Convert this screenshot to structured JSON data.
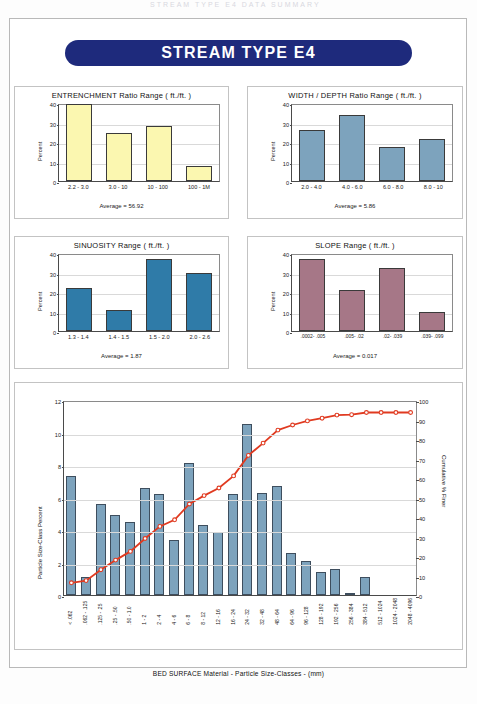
{
  "scan_header": "STREAM  TYPE  E4  DATA  SUMMARY",
  "banner": {
    "title": "STREAM  TYPE  E4"
  },
  "colors": {
    "banner_blue": "#1e2a7c",
    "entrenchment_bar": "#fbf7b0",
    "width_depth_bar": "#7da3bd",
    "sinuosity_bar": "#2f7ba8",
    "slope_bar": "#a67787",
    "bed_bar": "#7da3bd",
    "cumulative_line": "#e03a20"
  },
  "charts": [
    {
      "id": "entrenchment",
      "chart_data": {
        "type": "bar",
        "title": "ENTRENCHMENT  Ratio Range ( ft./ft. )",
        "categories": [
          "2.2 - 3.0",
          "3.0 - 10",
          "10 - 100",
          "100 - 1M"
        ],
        "values": [
          39.5,
          24.8,
          28.0,
          7.6
        ],
        "xlabel": "",
        "ylabel": "Percent",
        "ylim": [
          0,
          40
        ],
        "yticks": [
          0,
          10,
          20,
          30,
          40
        ],
        "grid": true,
        "bar_color": "#fbf7b0"
      },
      "average_label": "Average = 56.92"
    },
    {
      "id": "width-depth",
      "chart_data": {
        "type": "bar",
        "title": "WIDTH / DEPTH  Ratio Range ( ft./ft. )",
        "categories": [
          "2.0 - 4.0",
          "4.0 - 6.0",
          "6.0 - 8.0",
          "8.0 - 10"
        ],
        "values": [
          26.0,
          33.8,
          17.7,
          21.6
        ],
        "xlabel": "",
        "ylabel": "Percent",
        "ylim": [
          0,
          40
        ],
        "yticks": [
          0,
          10,
          20,
          30,
          40
        ],
        "grid": true,
        "bar_color": "#7da3bd"
      },
      "average_label": "Average = 5.86"
    },
    {
      "id": "sinuosity",
      "chart_data": {
        "type": "bar",
        "title": "SINUOSITY  Range ( ft./ft. )",
        "categories": [
          "1.3 - 1.4",
          "1.4 - 1.5",
          "1.5 - 2.0",
          "2.0 - 2.6"
        ],
        "values": [
          22.0,
          11.0,
          37.0,
          30.0
        ],
        "xlabel": "",
        "ylabel": "Percent",
        "ylim": [
          0,
          40
        ],
        "yticks": [
          0,
          10,
          20,
          30,
          40
        ],
        "grid": true,
        "bar_color": "#2f7ba8"
      },
      "average_label": "Average = 1.87"
    },
    {
      "id": "slope",
      "chart_data": {
        "type": "bar",
        "title": "SLOPE  Range ( ft./ft. )",
        "categories": [
          ".0002- .005",
          ".005- .02",
          ".02- .039",
          ".039- .099"
        ],
        "values": [
          36.8,
          20.8,
          32.4,
          9.6
        ],
        "xlabel": "",
        "ylabel": "Percent",
        "ylim": [
          0,
          40
        ],
        "yticks": [
          0,
          10,
          20,
          30,
          40
        ],
        "grid": true,
        "bar_color": "#a67787"
      },
      "average_label": "Average = 0.017"
    }
  ],
  "bed_surface": {
    "chart_data": {
      "type": "bar",
      "title": "",
      "xlabel": "BED SURFACE  Material  -  Particle Size-Classes  -  (mm)",
      "ylabel": "Particle Size-Class Percent",
      "y2label": "Cumulative % Finer",
      "ylim": [
        0,
        12
      ],
      "yticks": [
        0,
        2,
        4,
        6,
        8,
        10,
        12
      ],
      "y2lim": [
        0,
        100
      ],
      "y2ticks": [
        0,
        10,
        20,
        30,
        40,
        50,
        60,
        70,
        80,
        90,
        100
      ],
      "grid": true,
      "categories": [
        "< .062",
        ".062 - .125",
        ".125 - .25",
        ".25 - .50",
        ".50 - 1.0",
        "1 - 2",
        "2 - 4",
        "4 - 6",
        "6 - 8",
        "8 - 12",
        "12 - 16",
        "16 - 24",
        "24 - 32",
        "32 - 48",
        "48 - 64",
        "64 - 96",
        "96 - 128",
        "128 - 192",
        "192 - 256",
        "256 - 384",
        "384 - 512",
        "512 - 1024",
        "1024 - 2048",
        "2048 - 4096"
      ],
      "series": [
        {
          "name": "Particle Size-Class Percent",
          "type": "bar",
          "values": [
            7.3,
            1.1,
            5.6,
            4.9,
            4.5,
            6.6,
            6.2,
            3.4,
            8.1,
            4.3,
            3.9,
            6.2,
            10.5,
            6.3,
            6.7,
            2.6,
            2.1,
            1.4,
            1.6,
            0.15,
            1.1,
            0.0,
            0.0,
            0.0
          ]
        },
        {
          "name": "Cumulative % Finer",
          "type": "line",
          "values": [
            7.3,
            8.4,
            14.0,
            18.9,
            23.4,
            30.0,
            36.2,
            39.6,
            47.7,
            52.0,
            55.9,
            62.1,
            72.6,
            78.9,
            85.6,
            88.2,
            90.3,
            91.7,
            93.3,
            93.5,
            94.6,
            94.6,
            94.6,
            94.6
          ]
        }
      ]
    }
  }
}
